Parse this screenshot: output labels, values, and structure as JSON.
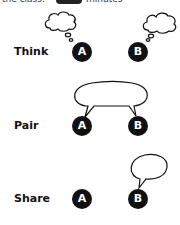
{
  "header": {
    "text_before": "the class.",
    "badge": "",
    "text_after": "minutes"
  },
  "rows": [
    {
      "label": "Think",
      "a": "A",
      "b": "B"
    },
    {
      "label": "Pair",
      "a": "A",
      "b": "B"
    },
    {
      "label": "Share",
      "a": "A",
      "b": "B"
    }
  ],
  "colors": {
    "ink": "#111111",
    "background": "#ffffff"
  }
}
